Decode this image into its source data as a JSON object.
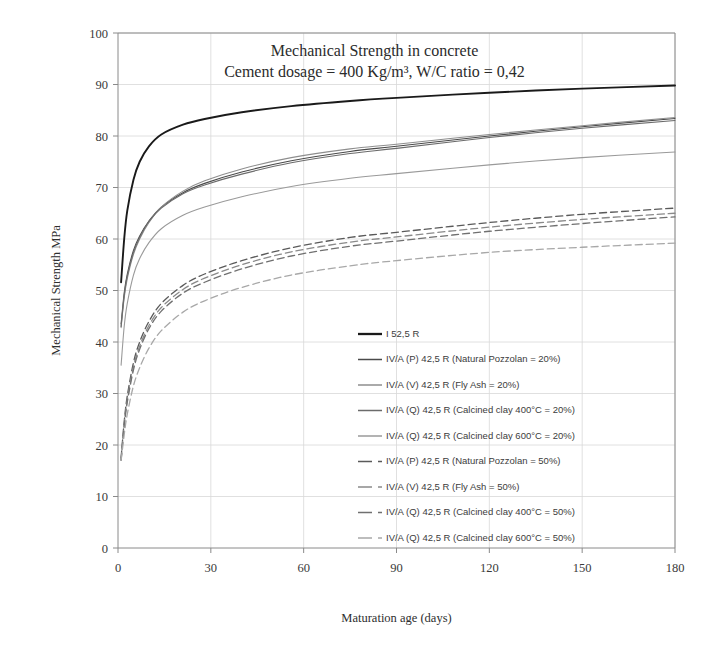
{
  "chart_data": {
    "type": "line",
    "title": "Mechanical Strength in concrete",
    "subtitle": "Cement dosage = 400 Kg/m³, W/C ratio = 0,42",
    "xlabel": "Maturation age (days)",
    "ylabel": "Mechanical Strength MPa",
    "xlim": [
      0,
      180
    ],
    "ylim": [
      0,
      100
    ],
    "xticks": [
      0,
      30,
      60,
      90,
      120,
      150,
      180
    ],
    "yticks": [
      0,
      10,
      20,
      30,
      40,
      50,
      60,
      70,
      80,
      90,
      100
    ],
    "grid": true,
    "legend_position": "inside-center-bottom",
    "x": [
      1,
      2,
      3,
      5,
      7,
      10,
      14,
      21,
      28,
      40,
      56,
      75,
      90,
      120,
      150,
      180
    ],
    "series": [
      {
        "name": "I 52,5 R",
        "label": "I 52,5 R",
        "color": "#1a1a1a",
        "width": 1.9,
        "dash": "none",
        "values": [
          51.6,
          60.0,
          65.5,
          71.5,
          75.0,
          78.0,
          80.3,
          82.2,
          83.3,
          84.6,
          85.8,
          86.8,
          87.4,
          88.4,
          89.2,
          89.8
        ]
      },
      {
        "name": "IV/A (P) 42,5 R (Natural Pozzolan = 20%)",
        "label": "IV/A (P) 42,5 R  (Natural Pozzolan = 20%)",
        "color": "#4a4a4a",
        "width": 1.1,
        "dash": "none",
        "values": [
          43.5,
          49.5,
          53.2,
          57.8,
          60.6,
          63.5,
          66.2,
          69.0,
          70.8,
          73.0,
          75.2,
          77.0,
          78.0,
          80.0,
          81.8,
          83.4
        ]
      },
      {
        "name": "IV/A (V) 42,5 R (Fly Ash = 20%)",
        "label": "IV/A (V) 42,5 R  (Fly Ash = 20%)",
        "color": "#8e8e8e",
        "width": 1.1,
        "dash": "none",
        "values": [
          42.8,
          48.6,
          52.3,
          57.0,
          60.0,
          63.2,
          66.2,
          69.3,
          71.3,
          73.6,
          75.8,
          77.5,
          78.4,
          80.3,
          82.0,
          83.6
        ]
      },
      {
        "name": "IV/A (Q) 42,5 R (Calcined clay 400°C = 20%)",
        "label": "IV/A (Q) 42,5 R  (Calcined clay 400°C = 20%)",
        "color": "#6b6b6b",
        "width": 1.1,
        "dash": "none",
        "values": [
          43.0,
          49.0,
          52.8,
          57.4,
          60.3,
          63.4,
          66.0,
          68.8,
          70.5,
          72.6,
          74.8,
          76.6,
          77.6,
          79.7,
          81.5,
          83.0
        ]
      },
      {
        "name": "IV/A (Q) 42,5 R (Calcined clay 600°C = 20%)",
        "label": "IV/A (Q) 42,5 R  (Calcined clay 600°C = 20%)",
        "color": "#9a9a9a",
        "width": 1.1,
        "dash": "none",
        "values": [
          35.5,
          43.0,
          47.5,
          53.0,
          56.2,
          59.3,
          62.0,
          64.6,
          66.2,
          68.2,
          70.2,
          71.8,
          72.7,
          74.4,
          75.8,
          76.9
        ]
      },
      {
        "name": "IV/A (P) 42,5 R (Natural Pozzolan = 50%)",
        "label": "IV/A (P) 42,5 R  (Natural Pozzolan = 50%)",
        "color": "#5a5a5a",
        "width": 1.3,
        "dash": "7,4",
        "values": [
          17.5,
          24.5,
          29.5,
          36.0,
          40.0,
          44.0,
          47.5,
          51.0,
          53.2,
          55.8,
          58.3,
          60.3,
          61.3,
          63.2,
          64.8,
          66.0
        ]
      },
      {
        "name": "IV/A (V) 42,5 R (Fly Ash = 50%)",
        "label": "IV/A (V) 42,5 R  (Fly Ash = 50%)",
        "color": "#8a8a8a",
        "width": 1.3,
        "dash": "7,4",
        "values": [
          17.2,
          24.0,
          28.8,
          35.2,
          39.2,
          43.2,
          46.7,
          50.2,
          52.4,
          55.0,
          57.5,
          59.4,
          60.4,
          62.3,
          63.8,
          65.0
        ]
      },
      {
        "name": "IV/A (Q) 42,5 R (Calcined clay 400°C = 50%)",
        "label": "IV/A (Q) 42,5 R  (Calcined clay 400°C = 50%)",
        "color": "#707070",
        "width": 1.3,
        "dash": "7,4",
        "values": [
          17.0,
          23.6,
          28.3,
          34.6,
          38.6,
          42.6,
          46.0,
          49.5,
          51.6,
          54.2,
          56.7,
          58.6,
          59.6,
          61.5,
          63.0,
          64.3
        ]
      },
      {
        "name": "IV/A (Q) 42,5 R (Calcined clay 600°C = 50%)",
        "label": "IV/A (Q) 42,5 R  (Calcined clay 600°C = 50%)",
        "color": "#a8a8a8",
        "width": 1.3,
        "dash": "7,4",
        "values": [
          17.0,
          22.0,
          26.0,
          31.5,
          35.0,
          38.8,
          42.2,
          45.8,
          48.0,
          50.6,
          53.0,
          54.8,
          55.8,
          57.4,
          58.4,
          59.2
        ]
      }
    ]
  }
}
